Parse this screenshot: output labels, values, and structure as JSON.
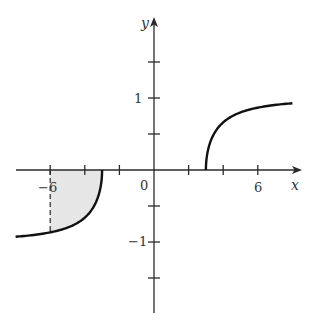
{
  "chart_data": {
    "type": "line",
    "title": "",
    "xlabel": "x",
    "ylabel": "y",
    "xlim": [
      -8,
      8
    ],
    "ylim": [
      -2,
      2
    ],
    "grid": false,
    "x_tick_labels": [
      {
        "value": -6,
        "label": "−6"
      },
      {
        "value": 0,
        "label": "0"
      },
      {
        "value": 6,
        "label": "6"
      }
    ],
    "y_tick_labels": [
      {
        "value": 1,
        "label": "1"
      },
      {
        "value": -1,
        "label": "−1"
      }
    ],
    "x_ticks": [
      -6,
      -4,
      -2,
      2,
      4,
      6
    ],
    "y_ticks": [
      -1.5,
      -1,
      -0.5,
      0.5,
      1,
      1.5
    ],
    "series": [
      {
        "name": "left branch",
        "function": "y = sqrt(x^2 - 9) / x",
        "x": [
          -8,
          -7,
          -6,
          -5,
          -4,
          -3.5,
          -3.2,
          -3
        ],
        "values": [
          -0.927,
          -0.904,
          -0.866,
          -0.8,
          -0.661,
          -0.515,
          -0.348,
          0
        ]
      },
      {
        "name": "right branch",
        "function": "y = sqrt(x^2 - 9) / x",
        "x": [
          3,
          3.2,
          3.5,
          4,
          5,
          6,
          7,
          8
        ],
        "values": [
          0,
          0.348,
          0.515,
          0.661,
          0.8,
          0.866,
          0.904,
          0.927
        ]
      }
    ],
    "annotations": [
      {
        "type": "shaded_region",
        "description": "area between curve and x-axis from x = -6 to x = -3",
        "x_range": [
          -6,
          -3
        ],
        "color": "#e6e6e6"
      },
      {
        "type": "dashed_line",
        "description": "vertical dashed line at x = -6 from axis to curve",
        "x": -6
      }
    ]
  },
  "labels": {
    "x_axis": "x",
    "y_axis": "y",
    "origin": "0",
    "x_neg6": "−6",
    "x_pos6": "6",
    "y_pos1": "1",
    "y_neg1": "−1"
  },
  "colors": {
    "axis": "#2a2a2a",
    "curve": "#111111",
    "shade": "#e6e6e6"
  }
}
